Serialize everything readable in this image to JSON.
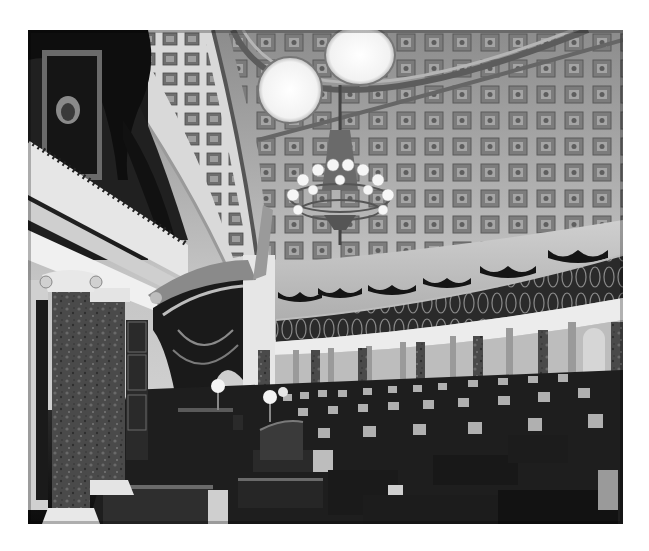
{
  "image": {
    "alt": "Black-and-white photograph of a historic semicircular legislative chamber with a coffered half-dome ceiling, two oculus skylights, a crystal chandelier, a curved visitors' gallery with ornate railing, marble columns, a canopied presiding officer's dais with draped curtains, a framed portrait on the left wall, and rows of wooden desks and chairs on the floor.",
    "style": "grayscale",
    "palette": {
      "highlight": "#f4f4f4",
      "light": "#d6d6d6",
      "mid": "#9a9a9a",
      "dark": "#3c3c3c",
      "shadow": "#111111"
    },
    "elements": [
      "coffered-dome-ceiling",
      "oculus-skylight",
      "oculus-skylight",
      "chandelier",
      "portrait-painting",
      "gallery-balcony",
      "gallery-railing",
      "marble-column",
      "marble-column",
      "canopy-drapery",
      "presiding-desk",
      "globe-lamp",
      "globe-lamp",
      "senate-desks",
      "chairs"
    ]
  }
}
